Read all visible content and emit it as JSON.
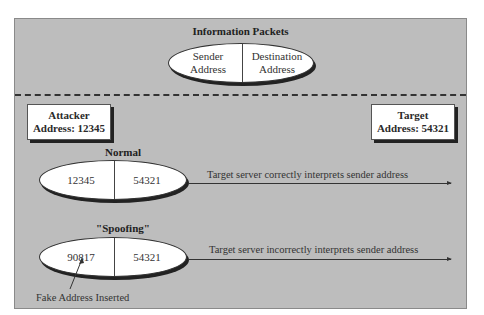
{
  "diagram": {
    "header": {
      "title": "Information Packets",
      "packet": {
        "left": {
          "line1": "Sender",
          "line2": "Address"
        },
        "right": {
          "line1": "Destination",
          "line2": "Address"
        }
      }
    },
    "attacker": {
      "line1": "Attacker",
      "line2": "Address: 12345"
    },
    "target": {
      "line1": "Target",
      "line2": "Address: 54321"
    },
    "normal": {
      "title": "Normal",
      "sender": "12345",
      "destination": "54321",
      "arrow_label": "Target server correctly interprets sender address"
    },
    "spoofing": {
      "title": "\"Spoofing\"",
      "sender": "90817",
      "destination": "54321",
      "arrow_label": "Target server incorrectly interprets sender address",
      "annotation": "Fake Address Inserted"
    },
    "colors": {
      "panel_bg": "#bdbdbd",
      "oval_bg": "#ffffff",
      "line": "#333333"
    }
  }
}
